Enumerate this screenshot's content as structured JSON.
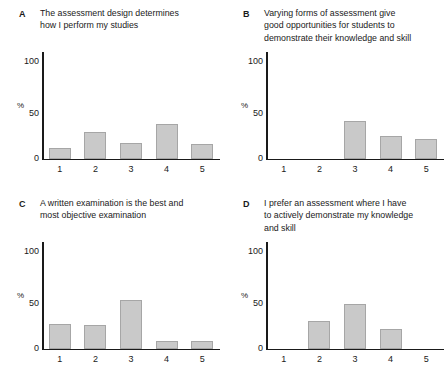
{
  "figure": {
    "axis": {
      "ylabel": "%",
      "yticks": [
        "100",
        "50",
        "0"
      ],
      "ylim": [
        0,
        113
      ],
      "xticks": [
        "1",
        "2",
        "3",
        "4",
        "5"
      ]
    }
  },
  "chart_data": [
    {
      "type": "bar",
      "panel": "A",
      "title": "The assessment design determines how I perform my studies",
      "title_lines": [
        "The assessment design determines",
        "how I perform my studies"
      ],
      "categories": [
        "1",
        "2",
        "3",
        "4",
        "5"
      ],
      "values": [
        11,
        28,
        16,
        37,
        15
      ],
      "xlabel": "",
      "ylabel": "%",
      "ylim": [
        0,
        113
      ],
      "yticks": [
        0,
        50,
        100
      ],
      "grid": false,
      "legend": "none",
      "bar_color": "#c9c9c9",
      "bar_edge_color": "#a6a6a6"
    },
    {
      "type": "bar",
      "panel": "B",
      "title": "Varying forms of assessment give good opportunities for students to demonstrate their knowledge and skill",
      "title_lines": [
        "Varying forms of assessment give",
        "good opportunities for students to",
        "demonstrate their knowledge and skill"
      ],
      "categories": [
        "1",
        "2",
        "3",
        "4",
        "5"
      ],
      "values": [
        0,
        0,
        40,
        24,
        21
      ],
      "xlabel": "",
      "ylabel": "%",
      "ylim": [
        0,
        113
      ],
      "yticks": [
        0,
        50,
        100
      ],
      "grid": false,
      "legend": "none",
      "bar_color": "#c9c9c9",
      "bar_edge_color": "#a6a6a6"
    },
    {
      "type": "bar",
      "panel": "C",
      "title": "A written examination is the best and most objective examination",
      "title_lines": [
        "A written examination is the best and",
        "most objective examination"
      ],
      "categories": [
        "1",
        "2",
        "3",
        "4",
        "5"
      ],
      "values": [
        26,
        25,
        52,
        8,
        8
      ],
      "xlabel": "",
      "ylabel": "%",
      "ylim": [
        0,
        113
      ],
      "yticks": [
        0,
        50,
        100
      ],
      "grid": false,
      "legend": "none",
      "bar_color": "#c9c9c9",
      "bar_edge_color": "#a6a6a6"
    },
    {
      "type": "bar",
      "panel": "D",
      "title": "I prefer an assessment where I have to actively demonstrate my knowledge and skill",
      "title_lines": [
        "I prefer an assessment where I have",
        "to actively demonstrate my knowledge",
        "and skill"
      ],
      "categories": [
        "1",
        "2",
        "3",
        "4",
        "5"
      ],
      "values": [
        0,
        29,
        47,
        21,
        0
      ],
      "xlabel": "",
      "ylabel": "%",
      "ylim": [
        0,
        113
      ],
      "yticks": [
        0,
        50,
        100
      ],
      "grid": false,
      "legend": "none",
      "bar_color": "#c9c9c9",
      "bar_edge_color": "#a6a6a6"
    }
  ]
}
